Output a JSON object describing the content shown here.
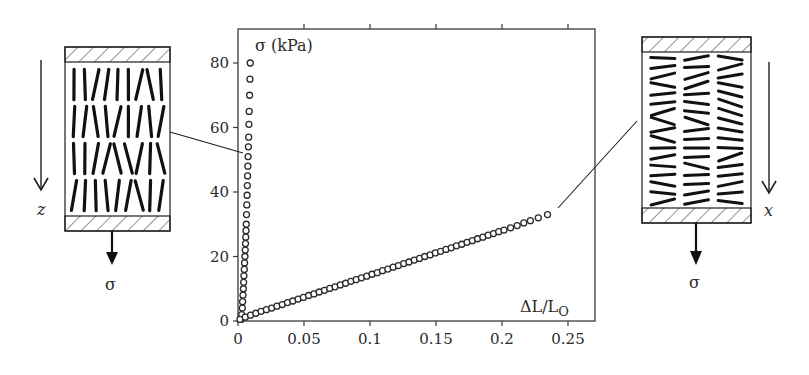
{
  "figure": {
    "ink_color": "#1e1e1e",
    "axis_color": "#3a3a3a",
    "marker_color": "#2a2a2a",
    "background": "#ffffff"
  },
  "chart_data": {
    "type": "scatter",
    "title": "",
    "xlabel": "ΔL/L",
    "xlabel_subscript": "O",
    "ylabel": "σ (kPa)",
    "xlim": [
      0,
      0.27
    ],
    "ylim": [
      0,
      90
    ],
    "xticks": [
      0,
      0.05,
      0.1,
      0.15,
      0.2,
      0.25
    ],
    "xtick_labels": [
      "0",
      "0.05",
      "0.1",
      "0.15",
      "0.2",
      "0.25"
    ],
    "yticks": [
      0,
      20,
      40,
      60,
      80
    ],
    "ytick_labels": [
      "0",
      "20",
      "40",
      "60",
      "80"
    ],
    "grid": false,
    "legend": null,
    "marker": "open-circle",
    "series": [
      {
        "name": "stress along z (stiff, fibres parallel to load)",
        "x": [
          0.0,
          0.0005,
          0.001,
          0.0012,
          0.0015,
          0.0018,
          0.002,
          0.0022,
          0.0025,
          0.0027,
          0.003,
          0.0032,
          0.0034,
          0.0036,
          0.0038,
          0.004,
          0.0042,
          0.0044,
          0.0046,
          0.0048,
          0.005,
          0.0052,
          0.0054,
          0.0056,
          0.0058,
          0.006,
          0.0062,
          0.0065,
          0.0068,
          0.007
        ],
        "y": [
          0.5,
          2,
          4,
          6,
          8,
          10,
          12,
          14,
          16,
          18,
          20,
          22,
          24,
          26,
          28,
          30,
          33,
          36,
          39,
          42,
          45,
          48,
          51,
          54,
          57,
          61,
          65,
          70,
          75,
          80
        ]
      },
      {
        "name": "stress along x (compliant, fibres perpendicular to load)",
        "x": [
          0.0,
          0.004,
          0.008,
          0.012,
          0.016,
          0.02,
          0.024,
          0.028,
          0.032,
          0.036,
          0.04,
          0.044,
          0.048,
          0.052,
          0.056,
          0.06,
          0.064,
          0.068,
          0.072,
          0.076,
          0.08,
          0.084,
          0.088,
          0.092,
          0.096,
          0.1,
          0.104,
          0.108,
          0.112,
          0.116,
          0.12,
          0.124,
          0.128,
          0.132,
          0.136,
          0.14,
          0.144,
          0.148,
          0.152,
          0.156,
          0.16,
          0.164,
          0.168,
          0.172,
          0.176,
          0.18,
          0.184,
          0.188,
          0.192,
          0.196,
          0.2,
          0.205,
          0.21,
          0.215,
          0.22,
          0.226,
          0.233
        ],
        "y": [
          0.5,
          1.2,
          1.8,
          2.4,
          3.0,
          3.5,
          4.0,
          4.6,
          5.1,
          5.7,
          6.2,
          6.8,
          7.3,
          7.9,
          8.4,
          9.0,
          9.5,
          10.1,
          10.6,
          11.2,
          11.7,
          12.3,
          12.8,
          13.4,
          13.9,
          14.5,
          15.0,
          15.6,
          16.1,
          16.7,
          17.2,
          17.8,
          18.3,
          18.9,
          19.4,
          20.0,
          20.5,
          21.1,
          21.6,
          22.2,
          22.7,
          23.3,
          23.8,
          24.4,
          24.9,
          25.5,
          26.0,
          26.6,
          27.1,
          27.7,
          28.2,
          28.9,
          29.6,
          30.4,
          31.1,
          32.0,
          33.0
        ]
      }
    ],
    "annotations": [
      {
        "text": "σ (kPa)",
        "role": "y-axis label inside plot, top-left"
      },
      {
        "text": "ΔL/LO",
        "role": "x-axis label inside plot, bottom-right"
      },
      {
        "text": "leader line from left sample schematic to z-curve at ~52 kPa"
      },
      {
        "text": "leader line from right sample schematic to end of x-curve (~0.233, 33 kPa)"
      }
    ]
  },
  "plot_frame": {
    "left": 238,
    "top": 29,
    "right": 595,
    "bottom": 321
  },
  "left_schematic": {
    "direction_label": "z",
    "load_label": "σ",
    "fibre_orientation": "vertical",
    "box": {
      "x": 65,
      "y": 47,
      "w": 105,
      "h": 184,
      "plate_h": 15
    }
  },
  "right_schematic": {
    "direction_label": "x",
    "load_label": "σ",
    "fibre_orientation": "horizontal",
    "box": {
      "x": 642,
      "y": 37,
      "w": 109,
      "h": 186,
      "plate_h": 15
    }
  },
  "leaders": [
    {
      "from": [
        170,
        132
      ],
      "to": [
        243,
        153
      ]
    },
    {
      "from": [
        637,
        121
      ],
      "to": [
        558,
        208
      ]
    }
  ]
}
